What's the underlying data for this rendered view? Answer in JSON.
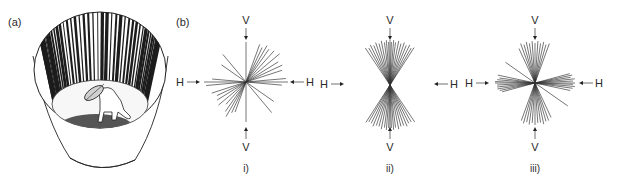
{
  "panels": {
    "a": {
      "label": "(a)"
    },
    "b": {
      "label": "(b)"
    }
  },
  "diagrams": [
    {
      "id": "i",
      "caption": "i)",
      "top": "V",
      "bottom": "V",
      "left": "H",
      "right": "H",
      "cx": 246,
      "cy": 82,
      "lines": [
        {
          "angle": 0,
          "r1": 42,
          "r2": 42
        },
        {
          "angle": 5,
          "r1": 40,
          "r2": 40
        },
        {
          "angle": 18,
          "r1": 38,
          "r2": 36
        },
        {
          "angle": 25,
          "r1": 40,
          "r2": 32
        },
        {
          "angle": 32,
          "r1": 38,
          "r2": 34
        },
        {
          "angle": 40,
          "r1": 44,
          "r2": 36
        },
        {
          "angle": 48,
          "r1": 42,
          "r2": 30
        },
        {
          "angle": 55,
          "r1": 40,
          "r2": 36
        },
        {
          "angle": 60,
          "r1": 42,
          "r2": 40
        },
        {
          "angle": 65,
          "r1": 38,
          "r2": 34
        },
        {
          "angle": 70,
          "r1": 40,
          "r2": 32
        },
        {
          "angle": 90,
          "r1": 40,
          "r2": 40
        },
        {
          "angle": 130,
          "r1": 36,
          "r2": 40
        },
        {
          "angle": 145,
          "r1": 30,
          "r2": 34
        },
        {
          "angle": -5,
          "r1": 36,
          "r2": 34
        }
      ]
    },
    {
      "id": "ii",
      "caption": "ii)",
      "top": "V",
      "bottom": "V",
      "left": "H",
      "right": "H",
      "cx": 390,
      "cy": 84,
      "lines": [
        {
          "angle": 55,
          "r1": 42,
          "r2": 42
        },
        {
          "angle": 58,
          "r1": 40,
          "r2": 40
        },
        {
          "angle": 62,
          "r1": 42,
          "r2": 40
        },
        {
          "angle": 66,
          "r1": 40,
          "r2": 42
        },
        {
          "angle": 70,
          "r1": 42,
          "r2": 40
        },
        {
          "angle": 74,
          "r1": 40,
          "r2": 40
        },
        {
          "angle": 78,
          "r1": 42,
          "r2": 42
        },
        {
          "angle": 82,
          "r1": 40,
          "r2": 40
        },
        {
          "angle": 85,
          "r1": 42,
          "r2": 42
        },
        {
          "angle": 88,
          "r1": 40,
          "r2": 40
        },
        {
          "angle": 90,
          "r1": 42,
          "r2": 42
        },
        {
          "angle": 92,
          "r1": 40,
          "r2": 40
        },
        {
          "angle": 95,
          "r1": 42,
          "r2": 42
        },
        {
          "angle": 98,
          "r1": 40,
          "r2": 40
        },
        {
          "angle": 102,
          "r1": 42,
          "r2": 42
        },
        {
          "angle": 106,
          "r1": 40,
          "r2": 40
        },
        {
          "angle": 110,
          "r1": 42,
          "r2": 40
        },
        {
          "angle": 114,
          "r1": 40,
          "r2": 42
        },
        {
          "angle": 118,
          "r1": 42,
          "r2": 40
        },
        {
          "angle": 122,
          "r1": 40,
          "r2": 40
        },
        {
          "angle": 126,
          "r1": 42,
          "r2": 42
        }
      ]
    },
    {
      "id": "iii",
      "caption": "iii)",
      "top": "V",
      "bottom": "V",
      "left": "H",
      "right": "H",
      "cx": 535,
      "cy": 83,
      "lines": [
        {
          "angle": -12,
          "r1": 36,
          "r2": 38
        },
        {
          "angle": -8,
          "r1": 38,
          "r2": 36
        },
        {
          "angle": -5,
          "r1": 40,
          "r2": 38
        },
        {
          "angle": -2,
          "r1": 38,
          "r2": 40
        },
        {
          "angle": 0,
          "r1": 40,
          "r2": 40
        },
        {
          "angle": 3,
          "r1": 38,
          "r2": 38
        },
        {
          "angle": 6,
          "r1": 40,
          "r2": 38
        },
        {
          "angle": 9,
          "r1": 36,
          "r2": 38
        },
        {
          "angle": 12,
          "r1": 38,
          "r2": 36
        },
        {
          "angle": 15,
          "r1": 36,
          "r2": 34
        },
        {
          "angle": 145,
          "r1": 36,
          "r2": 40
        },
        {
          "angle": 70,
          "r1": 42,
          "r2": 40
        },
        {
          "angle": 74,
          "r1": 40,
          "r2": 42
        },
        {
          "angle": 78,
          "r1": 42,
          "r2": 40
        },
        {
          "angle": 82,
          "r1": 40,
          "r2": 42
        },
        {
          "angle": 86,
          "r1": 42,
          "r2": 40
        },
        {
          "angle": 90,
          "r1": 40,
          "r2": 42
        },
        {
          "angle": 94,
          "r1": 42,
          "r2": 40
        },
        {
          "angle": 98,
          "r1": 40,
          "r2": 40
        },
        {
          "angle": 102,
          "r1": 42,
          "r2": 42
        },
        {
          "angle": 106,
          "r1": 40,
          "r2": 40
        },
        {
          "angle": 110,
          "r1": 42,
          "r2": 40
        },
        {
          "angle": 115,
          "r1": 38,
          "r2": 38
        }
      ]
    }
  ],
  "drum": {
    "stripe_count": 44,
    "fill_light": "#f4f4f4",
    "floor_color": "#555555",
    "line_color": "#222222"
  }
}
